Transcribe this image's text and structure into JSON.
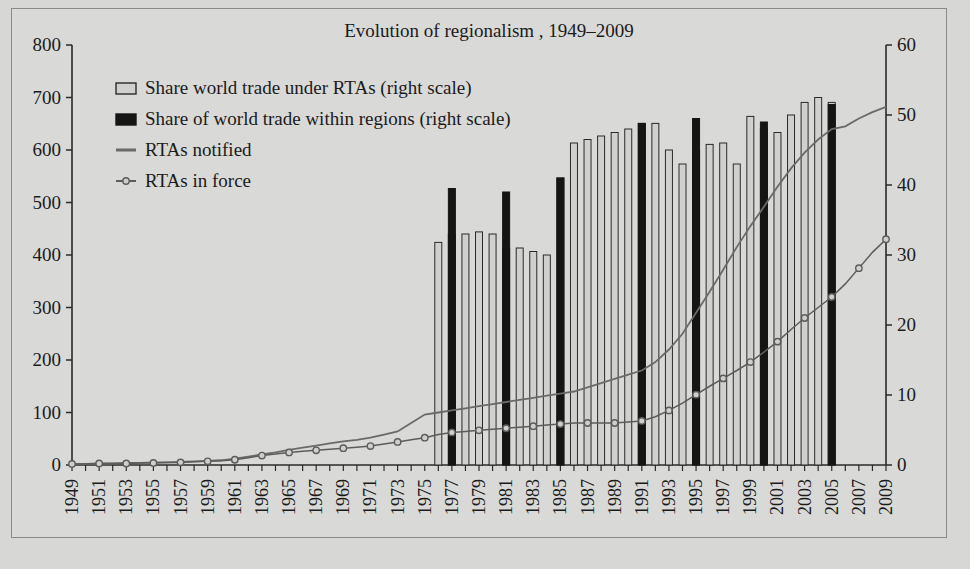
{
  "chart_data": {
    "type": "bar",
    "title": "Evolution of regionalism , 1949–2009",
    "xlabel": "",
    "ylabel": "",
    "ylim": [
      0,
      800
    ],
    "y2lim": [
      0,
      60
    ],
    "grid": false,
    "legend_position": "upper-left",
    "left_axis_ticks": [
      "0",
      "100",
      "200",
      "300",
      "400",
      "500",
      "600",
      "700",
      "800"
    ],
    "right_axis_ticks": [
      "0",
      "10",
      "20",
      "30",
      "40",
      "50",
      "60"
    ],
    "x_tick_labels": [
      "1949",
      "1951",
      "1953",
      "1955",
      "1957",
      "1959",
      "1961",
      "1963",
      "1965",
      "1967",
      "1969",
      "1971",
      "1973",
      "1975",
      "1977",
      "1979",
      "1981",
      "1983",
      "1985",
      "1987",
      "1989",
      "1991",
      "1993",
      "1995",
      "1997",
      "1999",
      "2001",
      "2003",
      "2005",
      "2007",
      "2009"
    ],
    "x": [
      1949,
      1950,
      1951,
      1952,
      1953,
      1954,
      1955,
      1956,
      1957,
      1958,
      1959,
      1960,
      1961,
      1962,
      1963,
      1964,
      1965,
      1966,
      1967,
      1968,
      1969,
      1970,
      1971,
      1972,
      1973,
      1974,
      1975,
      1976,
      1977,
      1978,
      1979,
      1980,
      1981,
      1982,
      1983,
      1984,
      1985,
      1986,
      1987,
      1988,
      1989,
      1990,
      1991,
      1992,
      1993,
      1994,
      1995,
      1996,
      1997,
      1998,
      1999,
      2000,
      2001,
      2002,
      2003,
      2004,
      2005,
      2006,
      2007,
      2008,
      2009
    ],
    "series": [
      {
        "name": "Share world trade under RTAs (right scale)",
        "type": "bar",
        "axis": "right",
        "color": "#d0d0ce",
        "edge_color": "#2a2a2a",
        "values": [
          null,
          null,
          null,
          null,
          null,
          null,
          null,
          null,
          null,
          null,
          null,
          null,
          null,
          null,
          null,
          null,
          null,
          null,
          null,
          null,
          null,
          null,
          null,
          null,
          null,
          null,
          null,
          31.8,
          33.0,
          33.0,
          33.3,
          33.0,
          31.0,
          31.0,
          30.5,
          30.0,
          41.0,
          46.0,
          46.5,
          47.0,
          47.5,
          48.0,
          48.8,
          48.8,
          45.0,
          43.0,
          45.0,
          45.8,
          46.0,
          43.0,
          49.8,
          48.0,
          47.5,
          50.0,
          51.8,
          52.5,
          51.8,
          null,
          null,
          null,
          null
        ]
      },
      {
        "name": "Share of world trade within regions (right scale)",
        "type": "bar",
        "axis": "right",
        "color": "#151515",
        "edge_color": "#151515",
        "values": [
          null,
          null,
          null,
          null,
          null,
          null,
          null,
          null,
          null,
          null,
          null,
          null,
          null,
          null,
          null,
          null,
          null,
          null,
          null,
          null,
          null,
          null,
          null,
          null,
          null,
          null,
          null,
          null,
          39.5,
          null,
          null,
          null,
          39.0,
          null,
          null,
          null,
          41.0,
          null,
          null,
          null,
          null,
          null,
          48.8,
          null,
          null,
          null,
          49.5,
          null,
          null,
          null,
          null,
          49.0,
          null,
          null,
          null,
          null,
          51.5,
          null,
          null,
          null,
          null
        ]
      },
      {
        "name": "RTAs notified",
        "type": "line",
        "axis": "left",
        "color": "#6a6a68",
        "values": [
          2,
          2,
          3,
          3,
          4,
          4,
          5,
          5,
          6,
          7,
          8,
          9,
          12,
          16,
          20,
          24,
          29,
          33,
          37,
          41,
          45,
          48,
          52,
          58,
          64,
          80,
          96,
          100,
          104,
          108,
          112,
          116,
          120,
          124,
          128,
          132,
          136,
          140,
          148,
          156,
          164,
          172,
          180,
          196,
          220,
          250,
          290,
          330,
          372,
          415,
          455,
          492,
          530,
          565,
          595,
          620,
          640,
          645,
          660,
          672,
          682
        ]
      },
      {
        "name": "RTAs in force",
        "type": "line-marker",
        "axis": "left",
        "color": "#5c5c5a",
        "values": [
          2,
          2,
          3,
          3,
          3,
          4,
          4,
          5,
          5,
          6,
          7,
          8,
          10,
          14,
          18,
          21,
          24,
          26,
          28,
          30,
          32,
          34,
          36,
          40,
          44,
          48,
          52,
          58,
          62,
          64,
          66,
          68,
          70,
          72,
          74,
          76,
          78,
          80,
          80,
          80,
          80,
          82,
          84,
          92,
          104,
          118,
          134,
          150,
          165,
          180,
          196,
          215,
          235,
          258,
          280,
          300,
          320,
          345,
          375,
          405,
          430
        ]
      }
    ],
    "legend": [
      {
        "label": "Share world trade under RTAs (right scale)",
        "swatch": "light-bar"
      },
      {
        "label": "Share of world trade within regions (right scale)",
        "swatch": "dark-bar"
      },
      {
        "label": "RTAs notified",
        "swatch": "line"
      },
      {
        "label": "RTAs in force",
        "swatch": "line-marker"
      }
    ],
    "colors": {
      "background": "#d7d7d5",
      "axis": "#2a2a2a",
      "bar_light": "#d0d0ce",
      "bar_dark": "#151515",
      "line_notified": "#6a6a68",
      "line_inforce": "#5c5c5a"
    }
  }
}
